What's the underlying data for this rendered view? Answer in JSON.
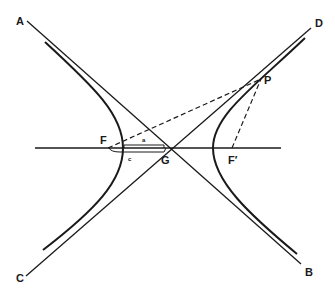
{
  "diagram": {
    "type": "hyperbola-geometry",
    "colors": {
      "ink": "#1a1a1a",
      "background": "#ffffff"
    },
    "labels": {
      "A": "A",
      "B": "B",
      "C": "C",
      "D": "D",
      "P": "P",
      "F": "F",
      "F_prime": "F′",
      "G": "G",
      "a": "a",
      "c": "c"
    },
    "elements": {
      "asymptotes": [
        "AB",
        "CD"
      ],
      "transverse_axis": "horizontal line through F, G, F′",
      "branches": [
        "left branch",
        "right branch"
      ],
      "focal_radii": [
        "FP (dashed)",
        "F′P (dashed)"
      ],
      "brackets": [
        "a: vertex to center",
        "c: focus to center"
      ]
    }
  }
}
